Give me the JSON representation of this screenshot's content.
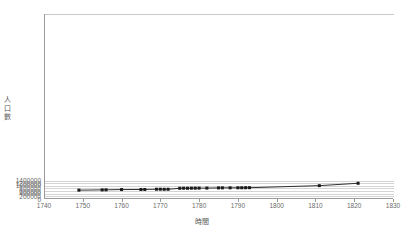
{
  "chart": {
    "title": "",
    "x_axis_title": "時間",
    "y_axis_title_chars": [
      "人",
      "口",
      "數"
    ],
    "yticks": [
      "0",
      "200000",
      "400000",
      "600000",
      "800000",
      "1000000",
      "1200000",
      "1400000"
    ],
    "xticks": [
      "1740",
      "1750",
      "1760",
      "1770",
      "1780",
      "1790",
      "1800",
      "1810",
      "1820",
      "1830"
    ],
    "line_color": "#1a1a1a",
    "grid_color": "#d4d4d4",
    "axis_color": "#9a9a9a"
  },
  "chart_data": {
    "type": "line",
    "title": "",
    "xlabel": "時間",
    "ylabel": "人口數",
    "xlim": [
      1740,
      1830
    ],
    "ylim": [
      0,
      14000000
    ],
    "xticks": [
      1740,
      1750,
      1760,
      1770,
      1780,
      1790,
      1800,
      1810,
      1820,
      1830
    ],
    "yticks": [
      0,
      200000,
      400000,
      600000,
      800000,
      1000000,
      1200000,
      1400000
    ],
    "grid": true,
    "legend": false,
    "markers": "filled-square",
    "series": [
      {
        "name": "人口數",
        "x": [
          1749,
          1755,
          1756,
          1760,
          1765,
          1766,
          1769,
          1770,
          1771,
          1772,
          1775,
          1776,
          1777,
          1778,
          1779,
          1780,
          1782,
          1785,
          1786,
          1788,
          1790,
          1791,
          1792,
          1793,
          1811,
          1821
        ],
        "y": [
          670000,
          690000,
          695000,
          715000,
          720000,
          722000,
          740000,
          742000,
          735000,
          738000,
          810000,
          815000,
          812000,
          818000,
          820000,
          822000,
          825000,
          840000,
          843000,
          845000,
          848000,
          850000,
          852000,
          855000,
          1010000,
          1190000
        ]
      }
    ]
  }
}
